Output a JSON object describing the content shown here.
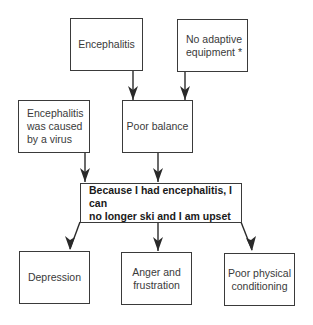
{
  "diagram": {
    "nodes": [
      {
        "id": "encephalitis",
        "label": "Encephalitis"
      },
      {
        "id": "no_adaptive",
        "label": "No adaptive\nequipment *"
      },
      {
        "id": "virus",
        "label": "Encephalitis\nwas caused\nby a virus"
      },
      {
        "id": "poor_balance",
        "label": "Poor balance"
      },
      {
        "id": "core",
        "label": "Because I had encephalitis, I can\nno longer ski and I am upset"
      },
      {
        "id": "depression",
        "label": "Depression"
      },
      {
        "id": "anger",
        "label": "Anger and\nfrustration"
      },
      {
        "id": "conditioning",
        "label": "Poor physical\nconditioning"
      }
    ],
    "edges": [
      {
        "from": "encephalitis",
        "to": "poor_balance"
      },
      {
        "from": "no_adaptive",
        "to": "poor_balance"
      },
      {
        "from": "virus",
        "to": "core"
      },
      {
        "from": "poor_balance",
        "to": "core"
      },
      {
        "from": "core",
        "to": "depression"
      },
      {
        "from": "core",
        "to": "anger"
      },
      {
        "from": "core",
        "to": "conditioning"
      }
    ]
  }
}
